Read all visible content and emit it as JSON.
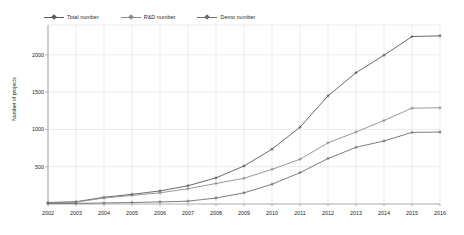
{
  "chart_data": {
    "type": "line",
    "title": "",
    "xlabel": "",
    "ylabel": "Number of projects",
    "categories": [
      2002,
      2003,
      2004,
      2005,
      2006,
      2007,
      2008,
      2009,
      2010,
      2011,
      2012,
      2013,
      2014,
      2015,
      2016
    ],
    "xlim": [
      2002,
      2016
    ],
    "ylim": [
      0,
      2400
    ],
    "yticks": [
      500,
      1000,
      1500,
      2000
    ],
    "ytick_labels": [
      "500",
      "1000",
      "1500",
      "2000"
    ],
    "xtick_labels": [
      "2002",
      "2003",
      "2004",
      "2005",
      "2006",
      "2007",
      "2008",
      "2009",
      "2010",
      "2011",
      "2012",
      "2013",
      "2014",
      "2015",
      "2016"
    ],
    "grid": true,
    "legend_position": "top-left",
    "series": [
      {
        "name": "Total number",
        "color": "#595959",
        "marker": "cross",
        "values": [
          20,
          30,
          90,
          130,
          175,
          245,
          350,
          510,
          735,
          1030,
          1450,
          1760,
          1995,
          2245,
          2255
        ]
      },
      {
        "name": "R&D number",
        "color": "#8c8c8c",
        "marker": "cross",
        "values": [
          18,
          25,
          80,
          115,
          150,
          205,
          275,
          345,
          465,
          600,
          820,
          965,
          1120,
          1285,
          1290
        ]
      },
      {
        "name": "Demo number",
        "color": "#6e6e6e",
        "marker": "cross",
        "values": [
          5,
          8,
          14,
          20,
          28,
          38,
          80,
          150,
          265,
          420,
          610,
          760,
          845,
          960,
          965
        ]
      }
    ]
  },
  "legend": {
    "items": [
      {
        "label": "Total number"
      },
      {
        "label": "R&D number"
      },
      {
        "label": "Demo number"
      }
    ]
  },
  "axes": {
    "y_title": "Number of projects"
  },
  "colors": {
    "total": "#595959",
    "rd": "#8c8c8c",
    "demo": "#6e6e6e",
    "grid": "#cfd4dc",
    "axis": "#8a8a8a",
    "text": "#1f1f1f"
  }
}
